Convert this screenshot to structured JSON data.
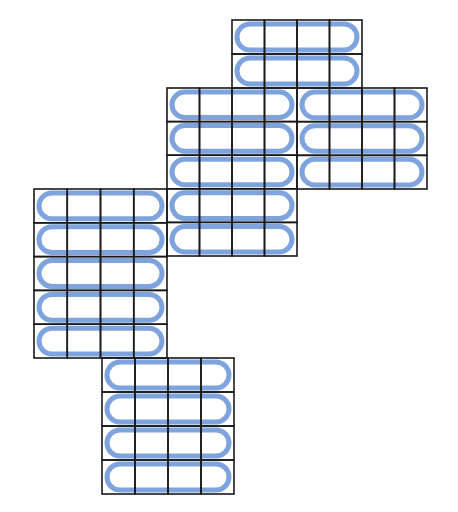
{
  "caption": "",
  "colors": {
    "grid_line": "#1a1a1a",
    "loop": "#7fa3dc",
    "background": "#ffffff"
  },
  "diagram": {
    "type": "karnaugh-style grid with grouped loops",
    "cell_columns_per_block": 4,
    "blocks": [
      {
        "id": "A",
        "x": 232,
        "y": 20,
        "w": 130,
        "h": 68,
        "cols": 4,
        "rows": 2,
        "loops": 2
      },
      {
        "id": "B",
        "x": 167,
        "y": 88,
        "w": 130,
        "h": 168,
        "cols": 4,
        "rows": 5,
        "loops": 5
      },
      {
        "id": "C",
        "x": 297,
        "y": 88,
        "w": 130,
        "h": 101,
        "cols": 4,
        "rows": 3,
        "loops": 3
      },
      {
        "id": "D",
        "x": 34,
        "y": 189,
        "w": 133,
        "h": 169,
        "cols": 4,
        "rows": 5,
        "loops": 5
      },
      {
        "id": "E",
        "x": 102,
        "y": 358,
        "w": 132,
        "h": 136,
        "cols": 4,
        "rows": 4,
        "loops": 4
      }
    ]
  }
}
